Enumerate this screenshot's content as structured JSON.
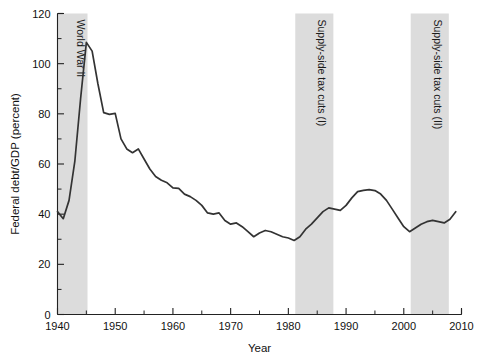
{
  "chart_data": {
    "type": "line",
    "title": "",
    "xlabel": "Year",
    "ylabel": "Federal debt/GDP (percent)",
    "xlim": [
      1940,
      2010
    ],
    "ylim": [
      0,
      120
    ],
    "grid": false,
    "legend_position": "none",
    "x_ticks": [
      1940,
      1950,
      1960,
      1970,
      1980,
      1990,
      2000,
      2010
    ],
    "x_tick_labels": [
      "1940",
      "1950",
      "1960",
      "1970",
      "1980",
      "1990",
      "2000",
      "2010"
    ],
    "x_minor_ticks": [
      1945,
      1955,
      1965,
      1975,
      1985,
      1995,
      2005
    ],
    "y_ticks": [
      0,
      20,
      40,
      60,
      80,
      100,
      120
    ],
    "y_tick_labels": [
      "0",
      "20",
      "40",
      "60",
      "80",
      "100",
      "120"
    ],
    "y_minor_ticks": [
      10,
      30,
      50,
      70,
      90,
      110
    ],
    "series": [
      {
        "name": "Federal debt/GDP",
        "color": "#333333",
        "x": [
          1940,
          1941,
          1942,
          1943,
          1944,
          1945,
          1946,
          1947,
          1948,
          1949,
          1950,
          1951,
          1952,
          1953,
          1954,
          1955,
          1956,
          1957,
          1958,
          1959,
          1960,
          1961,
          1962,
          1963,
          1964,
          1965,
          1966,
          1967,
          1968,
          1969,
          1970,
          1971,
          1972,
          1973,
          1974,
          1975,
          1976,
          1977,
          1978,
          1979,
          1980,
          1981,
          1982,
          1983,
          1984,
          1985,
          1986,
          1987,
          1988,
          1989,
          1990,
          1991,
          1992,
          1993,
          1994,
          1995,
          1996,
          1997,
          1998,
          1999,
          2000,
          2001,
          2002,
          2003,
          2004,
          2005,
          2006,
          2007,
          2008,
          2009
        ],
        "y": [
          41.0,
          38.2,
          45.5,
          61.0,
          86.0,
          108.5,
          105.0,
          92.0,
          80.5,
          79.8,
          80.2,
          70.0,
          66.0,
          64.5,
          66.0,
          62.0,
          58.0,
          55.0,
          53.5,
          52.5,
          50.5,
          50.3,
          48.0,
          47.0,
          45.5,
          43.5,
          40.5,
          40.0,
          40.5,
          37.5,
          36.0,
          36.5,
          35.0,
          33.0,
          31.0,
          32.5,
          33.5,
          33.0,
          32.0,
          31.0,
          30.5,
          29.5,
          31.0,
          34.0,
          36.0,
          38.5,
          41.0,
          42.5,
          42.0,
          41.5,
          43.5,
          46.5,
          49.0,
          49.5,
          49.8,
          49.4,
          48.0,
          45.5,
          42.0,
          38.5,
          35.0,
          33.0,
          34.5,
          36.0,
          37.0,
          37.5,
          37.0,
          36.5,
          38.0,
          41.0
        ]
      }
    ],
    "bands": [
      {
        "label": "World War II",
        "start": 1940,
        "end": 1945.2,
        "color": "#dcdcdc"
      },
      {
        "label": "Supply-side tax cuts (I)",
        "start": 1981.2,
        "end": 1987.8,
        "color": "#dcdcdc"
      },
      {
        "label": "Supply-side tax cuts (II)",
        "start": 2001.2,
        "end": 2007.8,
        "color": "#dcdcdc"
      }
    ]
  }
}
